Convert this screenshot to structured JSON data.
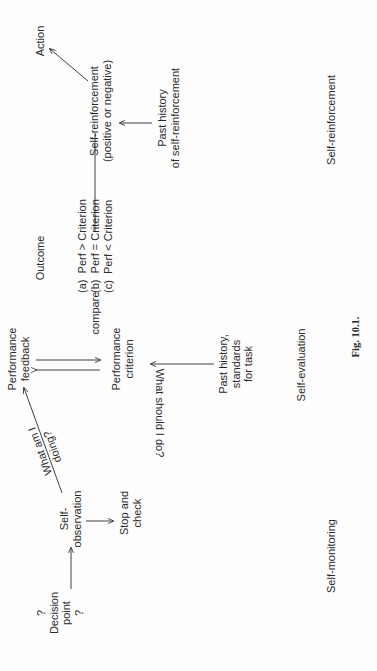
{
  "figure": {
    "caption": "Fig. 10.1.",
    "orientation": "rotated 90° counter-clockwise on page",
    "nodes": {
      "decision_point": "?\nDecision\npoint\n?",
      "self_observation": "Self-\nobservation",
      "stop_and_check": "Stop and\ncheck",
      "what_am_i_doing": "What am I\ndoing?",
      "performance_feedback": "Performance\nfeedback",
      "performance_criterion": "Performance\ncriterion",
      "what_should_i_do": "What should I do?",
      "past_history_standards": "Past history,\nstandards\nfor task",
      "outcome_title": "Outcome",
      "compare_label": "compare",
      "outcomes": [
        "(a)  Perf > Criterion",
        "(b)  Perf = Criterion",
        "(c)  Perf < Criterion"
      ],
      "self_reinforcement_node": "Self-reinforcement\n(positive or negative)",
      "action": "Action",
      "past_history_self_reinforcement": "Past history\nof self-reinforcement"
    },
    "stages": {
      "self_monitoring": "Self-monitoring",
      "self_evaluation": "Self-evaluation",
      "self_reinforcement": "Self-reinforcement"
    },
    "edges": [
      {
        "from": "Decision point",
        "to": "Self-observation"
      },
      {
        "from": "Self-observation",
        "to": "Stop and check"
      },
      {
        "from": "Self-observation",
        "to": "Performance feedback",
        "label": "What am I doing?"
      },
      {
        "from": "Performance feedback",
        "to": "Performance criterion"
      },
      {
        "from": "Performance criterion",
        "to": "Performance feedback"
      },
      {
        "from": "Past history, standards for task",
        "to": "Performance criterion",
        "label": "What should I do?"
      },
      {
        "from": "Outcome (b)",
        "to": "Self-reinforcement"
      },
      {
        "from": "Past history of self-reinforcement",
        "to": "Self-reinforcement"
      },
      {
        "from": "Self-reinforcement",
        "to": "Action"
      }
    ],
    "colors": {
      "ink": "#2a2a2a",
      "paper": "#fdfdfd"
    }
  }
}
